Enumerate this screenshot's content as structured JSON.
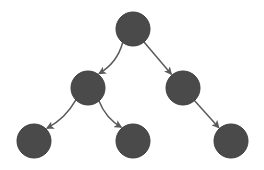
{
  "diagram": {
    "type": "binary-tree",
    "colors": {
      "node_fill": "#4a4a4a",
      "node_stroke": "#3e3e3e",
      "edge": "#5a5a5a",
      "background": "#ffffff"
    },
    "node_radius": 17,
    "nodes": [
      {
        "id": "root",
        "x": 133,
        "y": 29
      },
      {
        "id": "left",
        "x": 88,
        "y": 88
      },
      {
        "id": "right",
        "x": 183,
        "y": 88
      },
      {
        "id": "left-left",
        "x": 34,
        "y": 141
      },
      {
        "id": "left-right",
        "x": 133,
        "y": 141
      },
      {
        "id": "right-right",
        "x": 231,
        "y": 141
      }
    ],
    "edges": [
      {
        "from": "root",
        "to": "left",
        "curve": -8
      },
      {
        "from": "root",
        "to": "right",
        "curve": 0
      },
      {
        "from": "left",
        "to": "left-left",
        "curve": -6
      },
      {
        "from": "left",
        "to": "left-right",
        "curve": 6
      },
      {
        "from": "right",
        "to": "right-right",
        "curve": 0
      }
    ]
  }
}
